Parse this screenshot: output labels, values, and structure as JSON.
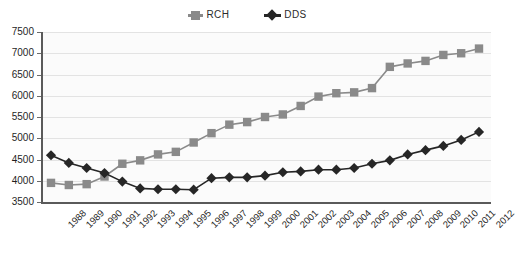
{
  "legend": {
    "position": "top-center",
    "entries": [
      {
        "label": "RCH",
        "marker": "square",
        "color": "#8a8a8a"
      },
      {
        "label": "DDS",
        "marker": "diamond",
        "color": "#262626"
      }
    ]
  },
  "axes": {
    "y_ticks": [
      "7500",
      "7000",
      "6500",
      "6000",
      "5500",
      "5000",
      "4500",
      "4000",
      "3500"
    ],
    "x_ticks": [
      "1988",
      "1989",
      "1990",
      "1991",
      "1992",
      "1993",
      "1994",
      "1995",
      "1996",
      "1997",
      "1998",
      "1999",
      "2000",
      "2001",
      "2002",
      "2003",
      "2004",
      "2005",
      "2006",
      "2007",
      "2008",
      "2009",
      "2010",
      "2011",
      "2012"
    ]
  },
  "chart_data": {
    "type": "line",
    "title": "",
    "xlabel": "",
    "ylabel": "",
    "ylim": [
      3500,
      7500
    ],
    "ytick_step": 500,
    "grid": true,
    "legend_position": "top-center",
    "categories": [
      "1988",
      "1989",
      "1990",
      "1991",
      "1992",
      "1993",
      "1994",
      "1995",
      "1996",
      "1997",
      "1998",
      "1999",
      "2000",
      "2001",
      "2002",
      "2003",
      "2004",
      "2005",
      "2006",
      "2007",
      "2008",
      "2009",
      "2010",
      "2011",
      "2012"
    ],
    "series": [
      {
        "name": "RCH",
        "marker": "square",
        "color": "#8a8a8a",
        "values": [
          3950,
          3900,
          3920,
          4100,
          4400,
          4480,
          4620,
          4680,
          4900,
          5120,
          5320,
          5380,
          5500,
          5560,
          5760,
          5980,
          6060,
          6080,
          6180,
          6680,
          6760,
          6820,
          6960,
          7000,
          7110
        ]
      },
      {
        "name": "DDS",
        "marker": "diamond",
        "color": "#262626",
        "values": [
          4600,
          4420,
          4300,
          4180,
          3980,
          3820,
          3800,
          3800,
          3790,
          4060,
          4080,
          4080,
          4120,
          4200,
          4220,
          4260,
          4260,
          4300,
          4400,
          4480,
          4620,
          4720,
          4820,
          4960,
          5150
        ]
      }
    ]
  }
}
